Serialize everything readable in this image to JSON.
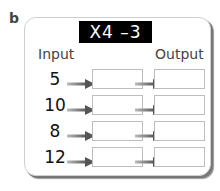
{
  "panel_label": "b",
  "machine_title": "X4 –3",
  "input_header": "Input",
  "output_header": "Output",
  "rows": [
    {
      "input": "5",
      "middle": "",
      "output": ""
    },
    {
      "input": "10",
      "middle": "",
      "output": ""
    },
    {
      "input": "8",
      "middle": "",
      "output": ""
    },
    {
      "input": "12",
      "middle": "",
      "output": ""
    }
  ]
}
